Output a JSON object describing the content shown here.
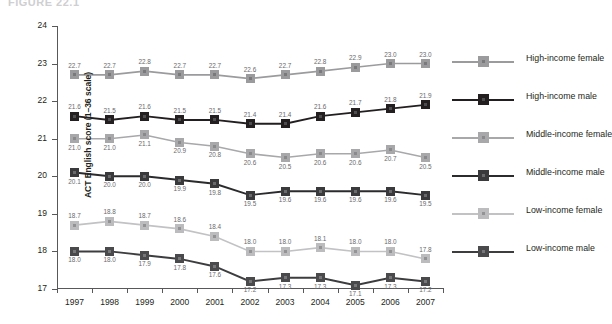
{
  "figure": {
    "top_remnant": "FIGURE 22.1",
    "ytitle": "ACT English score (1–36 scale)"
  },
  "legend": {
    "position": "right",
    "items": [
      {
        "label": "High-income female",
        "color": "#9b9b9e",
        "inner": "#7a7a7d",
        "line": "#9b9b9e"
      },
      {
        "label": "High-income male",
        "color": "#231f20",
        "inner": "#4d4d50",
        "line": "#231f20"
      },
      {
        "label": "Middle-income female",
        "color": "#a8a8ab",
        "inner": "#8a8a8d",
        "line": "#a8a8ab"
      },
      {
        "label": "Middle-income male",
        "color": "#3a3a3d",
        "inner": "#6a6a6d",
        "line": "#2b2b2e"
      },
      {
        "label": "Low-income female",
        "color": "#bcbcbf",
        "inner": "#939396",
        "line": "#c2c2c5"
      },
      {
        "label": "Low-income male",
        "color": "#4a4a4d",
        "inner": "#777779",
        "line": "#3d3d40"
      }
    ]
  },
  "chart_data": {
    "type": "line",
    "title": "",
    "xlabel": "",
    "ylabel": "ACT English score (1–36 scale)",
    "ylim": [
      17,
      24
    ],
    "yticks": [
      17,
      18,
      19,
      20,
      21,
      22,
      23,
      24
    ],
    "grid": false,
    "legend_position": "right",
    "categories": [
      "1997",
      "1998",
      "1999",
      "2000",
      "2001",
      "2002",
      "2003",
      "2004",
      "2005",
      "2006",
      "2007"
    ],
    "series": [
      {
        "name": "High-income female",
        "label_position": "above",
        "values": [
          22.7,
          22.7,
          22.8,
          22.7,
          22.7,
          22.6,
          22.7,
          22.8,
          22.9,
          23.0,
          23.0
        ]
      },
      {
        "name": "High-income male",
        "label_position": "above",
        "values": [
          21.6,
          21.5,
          21.6,
          21.5,
          21.5,
          21.4,
          21.4,
          21.6,
          21.7,
          21.8,
          21.9
        ]
      },
      {
        "name": "Middle-income female",
        "label_position": "below",
        "values": [
          21.0,
          21.0,
          21.1,
          20.9,
          20.8,
          20.6,
          20.5,
          20.6,
          20.6,
          20.7,
          20.5
        ]
      },
      {
        "name": "Middle-income male",
        "label_position": "below",
        "values": [
          20.1,
          20.0,
          20.0,
          19.9,
          19.8,
          19.5,
          19.6,
          19.6,
          19.6,
          19.6,
          19.5
        ]
      },
      {
        "name": "Low-income female",
        "label_position": "above",
        "values": [
          18.7,
          18.8,
          18.7,
          18.6,
          18.4,
          18.0,
          18.0,
          18.1,
          18.0,
          18.0,
          17.8
        ]
      },
      {
        "name": "Low-income male",
        "label_position": "below",
        "values": [
          18.0,
          18.0,
          17.9,
          17.8,
          17.6,
          17.2,
          17.3,
          17.3,
          17.1,
          17.3,
          17.2
        ]
      }
    ]
  }
}
